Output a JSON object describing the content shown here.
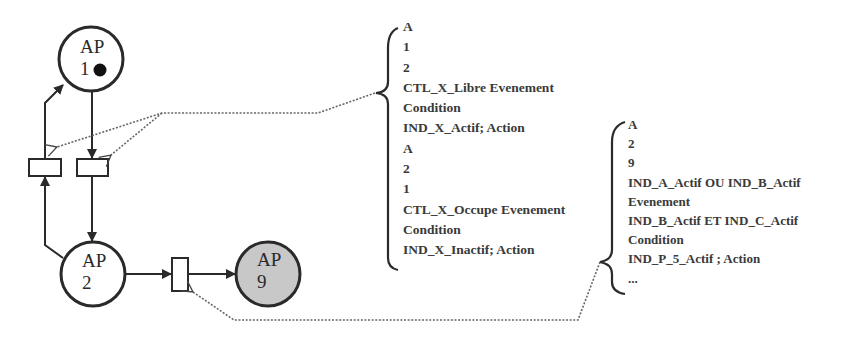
{
  "places": [
    {
      "id": "ap1",
      "label_top": "AP",
      "label_bottom": "1",
      "token": true,
      "fill": "#ffffff"
    },
    {
      "id": "ap2",
      "label_top": "AP",
      "label_bottom": "2",
      "token": false,
      "fill": "#ffffff"
    },
    {
      "id": "ap9",
      "label_top": "AP",
      "label_bottom": "9",
      "token": false,
      "fill": "#c8c8c8"
    }
  ],
  "transitions_description": [
    {
      "lines": [
        "A",
        "1",
        "2",
        "CTL_X_Libre Evenement",
        "Condition",
        "IND_X_Actif; Action",
        "A",
        "2",
        "1",
        "CTL_X_Occupe Evenement",
        "Condition",
        "IND_X_Inactif; Action"
      ]
    },
    {
      "lines": [
        "A",
        "2",
        "9",
        "IND_A_Actif OU IND_B_Actif",
        "Evenement",
        "IND_B_Actif ET IND_C_Actif",
        "Condition",
        "IND_P_5_Actif ; Action",
        "..."
      ]
    }
  ],
  "colors": {
    "stroke": "#2a2a2a",
    "ap9_fill": "#c8c8c8",
    "text": "#3a3a3a",
    "dotted": "#666666"
  }
}
